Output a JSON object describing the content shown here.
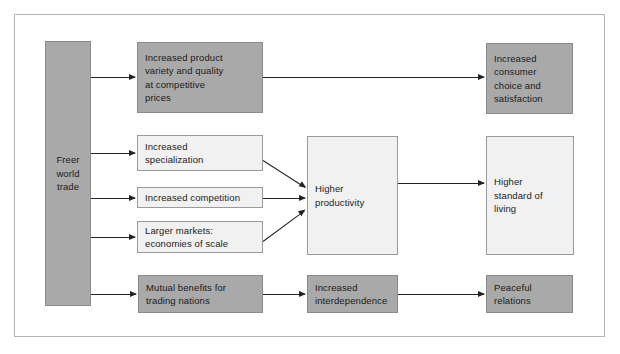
{
  "diagram": {
    "colors": {
      "dark_box_fill": "#a9a9a9",
      "light_box_fill": "#f1f1f1",
      "box_border": "#8e8e8e",
      "arrow": "#222222",
      "frame_border": "#b5b5b5",
      "background": "#ffffff",
      "text": "#1b1b1b"
    },
    "nodes": [
      {
        "id": "freer-world-trade",
        "label": "Freer\nworld\ntrade",
        "style": "dark"
      },
      {
        "id": "increased-product-variety",
        "label": "Increased product\nvariety and quality\nat competitive\nprices",
        "style": "dark"
      },
      {
        "id": "increased-consumer-choice",
        "label": "Increased\nconsumer\nchoice and\nsatisfaction",
        "style": "dark"
      },
      {
        "id": "increased-specialization",
        "label": "Increased\nspecialization",
        "style": "light"
      },
      {
        "id": "increased-competition",
        "label": "Increased competition",
        "style": "light"
      },
      {
        "id": "larger-markets",
        "label": "Larger markets:\neconomies of scale",
        "style": "light"
      },
      {
        "id": "higher-productivity",
        "label": "Higher\nproductivity",
        "style": "light"
      },
      {
        "id": "higher-standard-of-living",
        "label": "Higher\nstandard of\nliving",
        "style": "light"
      },
      {
        "id": "mutual-benefits",
        "label": "Mutual benefits for\ntrading nations",
        "style": "dark"
      },
      {
        "id": "increased-interdependence",
        "label": "Increased\ninterdependence",
        "style": "dark"
      },
      {
        "id": "peaceful-relations",
        "label": "Peaceful\nrelations",
        "style": "dark"
      }
    ],
    "edges": [
      {
        "from": "freer-world-trade",
        "to": "increased-product-variety"
      },
      {
        "from": "freer-world-trade",
        "to": "increased-specialization"
      },
      {
        "from": "freer-world-trade",
        "to": "increased-competition"
      },
      {
        "from": "freer-world-trade",
        "to": "larger-markets"
      },
      {
        "from": "freer-world-trade",
        "to": "mutual-benefits"
      },
      {
        "from": "increased-product-variety",
        "to": "increased-consumer-choice"
      },
      {
        "from": "increased-specialization",
        "to": "higher-productivity"
      },
      {
        "from": "increased-competition",
        "to": "higher-productivity"
      },
      {
        "from": "larger-markets",
        "to": "higher-productivity"
      },
      {
        "from": "higher-productivity",
        "to": "higher-standard-of-living"
      },
      {
        "from": "mutual-benefits",
        "to": "increased-interdependence"
      },
      {
        "from": "increased-interdependence",
        "to": "peaceful-relations"
      }
    ]
  }
}
